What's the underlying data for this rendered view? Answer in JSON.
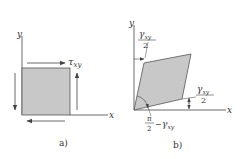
{
  "panel_a": {
    "caption": "a)",
    "x_axis_label": "x",
    "y_axis_label": "y",
    "shear_stress_label": "τ",
    "shear_stress_subscript": "xy",
    "element_fill": "#c8c8c8"
  },
  "panel_b": {
    "caption": "b)",
    "x_axis_label": "x",
    "y_axis_label": "y",
    "top_angle": {
      "numerator_symbol": "γ",
      "subscript": "xy",
      "denominator": "2"
    },
    "right_angle": {
      "numerator_symbol": "γ",
      "subscript": "xy",
      "denominator": "2"
    },
    "corner_angle": {
      "numerator": "π",
      "denominator": "2",
      "minus": "−",
      "symbol": "γ",
      "subscript": "xy"
    },
    "element_fill": "#c8c8c8"
  },
  "colors": {
    "line": "#444444",
    "fill": "#c8c8c8",
    "text": "#333333"
  }
}
